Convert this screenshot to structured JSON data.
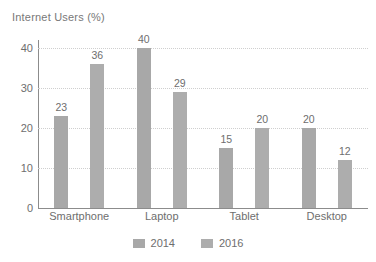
{
  "chart_data": {
    "type": "bar",
    "title": "Internet Users (%)",
    "xlabel": "",
    "ylabel": "",
    "ylim": [
      0,
      42
    ],
    "yticks": [
      0,
      10,
      20,
      30,
      40
    ],
    "ytick_labels": [
      "0",
      "10",
      "20",
      "30",
      "40"
    ],
    "grid": true,
    "grid_axis": "y",
    "legend_position": "bottom",
    "categories": [
      "Smartphone",
      "Laptop",
      "Tablet",
      "Desktop"
    ],
    "series": [
      {
        "name": "2014",
        "color": "#a8a8a8",
        "values": [
          23,
          40,
          15,
          20
        ],
        "value_labels": [
          "23",
          "40",
          "15",
          "20"
        ]
      },
      {
        "name": "2016",
        "color": "#adadad",
        "values": [
          36,
          29,
          20,
          12
        ],
        "value_labels": [
          "36",
          "29",
          "20",
          "12"
        ]
      }
    ]
  },
  "legend": {
    "items": [
      {
        "label": "2014",
        "color": "#a8a8a8"
      },
      {
        "label": "2016",
        "color": "#adadad"
      }
    ]
  },
  "axis": {
    "line_color": "#8c8c8c",
    "grid_color": "#cfcfcf",
    "text_color": "#6e6e6e"
  }
}
